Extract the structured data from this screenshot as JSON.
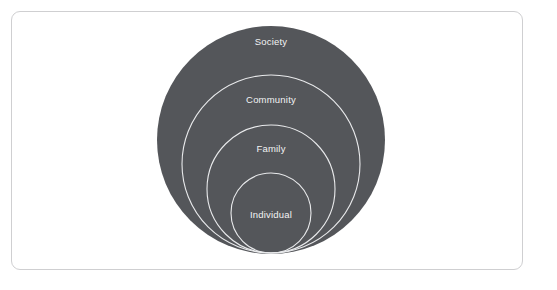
{
  "card": {
    "background_color": "#ffffff",
    "border_color": "#cfcfd1"
  },
  "diagram": {
    "title": "",
    "type": "nested-circles",
    "fill_color": "#54565a",
    "ring_stroke_color": "#e9eaec",
    "label_color": "#f2f3f4",
    "tangent_point": {
      "x": 259,
      "y": 241
    },
    "rings": [
      {
        "id": "society",
        "label": "Society",
        "level": 4,
        "center": {
          "x": 259,
          "y": 128
        },
        "radius": 114,
        "filled": true,
        "label_position": {
          "x": 259,
          "y": 30
        }
      },
      {
        "id": "community",
        "label": "Community",
        "level": 3,
        "center": {
          "x": 259,
          "y": 152
        },
        "radius": 89,
        "filled": false,
        "label_position": {
          "x": 259,
          "y": 88
        }
      },
      {
        "id": "family",
        "label": "Family",
        "level": 2,
        "center": {
          "x": 259,
          "y": 177
        },
        "radius": 64,
        "filled": false,
        "label_position": {
          "x": 259,
          "y": 137
        }
      },
      {
        "id": "individual",
        "label": "Individual",
        "level": 1,
        "center": {
          "x": 259,
          "y": 201
        },
        "radius": 40,
        "filled": false,
        "label_position": {
          "x": 259,
          "y": 203
        }
      }
    ]
  }
}
